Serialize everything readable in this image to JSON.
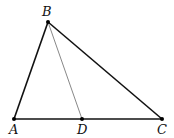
{
  "diagram": {
    "type": "triangle",
    "points": {
      "A": {
        "label": "A",
        "x": 14,
        "y": 119
      },
      "B": {
        "label": "B",
        "x": 48,
        "y": 22
      },
      "C": {
        "label": "C",
        "x": 162,
        "y": 119
      },
      "D": {
        "label": "D",
        "x": 82,
        "y": 119
      }
    },
    "segments": [
      "AB",
      "BC",
      "AC",
      "BD"
    ],
    "colors": {
      "main": "#111111",
      "cevian": "#888888"
    }
  }
}
